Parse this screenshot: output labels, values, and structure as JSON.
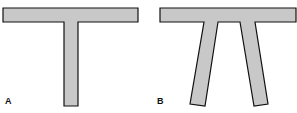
{
  "figure": {
    "panels": [
      {
        "label": "A",
        "description": "T-shaped beam: horizontal top bar with single vertical stem"
      },
      {
        "label": "B",
        "description": "Pi-shaped beam: horizontal top bar with two splayed legs"
      }
    ],
    "colors": {
      "fill": "#c8c8c8",
      "stroke": "#111111",
      "background": "#ffffff"
    }
  }
}
